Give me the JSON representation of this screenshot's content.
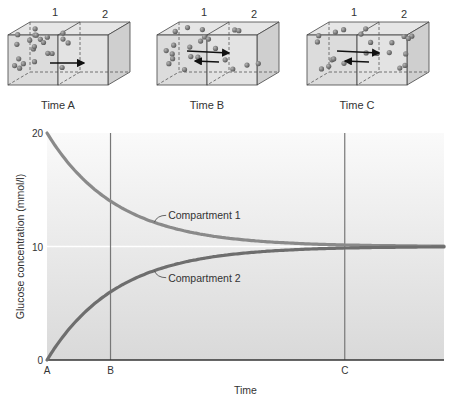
{
  "panels": [
    {
      "id": "A",
      "caption": "Time A",
      "compartment_labels": [
        "1",
        "2"
      ],
      "arrows": [
        "right"
      ],
      "particles_left": 22,
      "particles_right": 0
    },
    {
      "id": "B",
      "caption": "Time B",
      "compartment_labels": [
        "1",
        "2"
      ],
      "arrows": [
        "right",
        "left"
      ],
      "particles_left": 15,
      "particles_right": 7
    },
    {
      "id": "C",
      "caption": "Time C",
      "compartment_labels": [
        "1",
        "2"
      ],
      "arrows": [
        "right",
        "left"
      ],
      "particles_left": 11,
      "particles_right": 11
    }
  ],
  "chart_data": {
    "type": "line",
    "title": "",
    "xlabel": "Time",
    "ylabel": "Glucose concentration (mmol/l)",
    "ylim": [
      0,
      20
    ],
    "yticks": [
      0,
      10,
      20
    ],
    "xticks": [
      "A",
      "B",
      "C"
    ],
    "xtick_positions": [
      0,
      0.16,
      0.75
    ],
    "reference_line_y": 10,
    "series": [
      {
        "name": "Compartment 1",
        "start": 20,
        "end": 10,
        "value_at_B": 14,
        "equilibrium_at": "C",
        "color": "#8a8a8a"
      },
      {
        "name": "Compartment 2",
        "start": 0,
        "end": 10,
        "value_at_B": 6,
        "equilibrium_at": "C",
        "color": "#6e6e6e"
      }
    ],
    "colors": {
      "background_top": "#f7f7f7",
      "background_bottom": "#dcdcdc",
      "axis": "#333333"
    }
  }
}
